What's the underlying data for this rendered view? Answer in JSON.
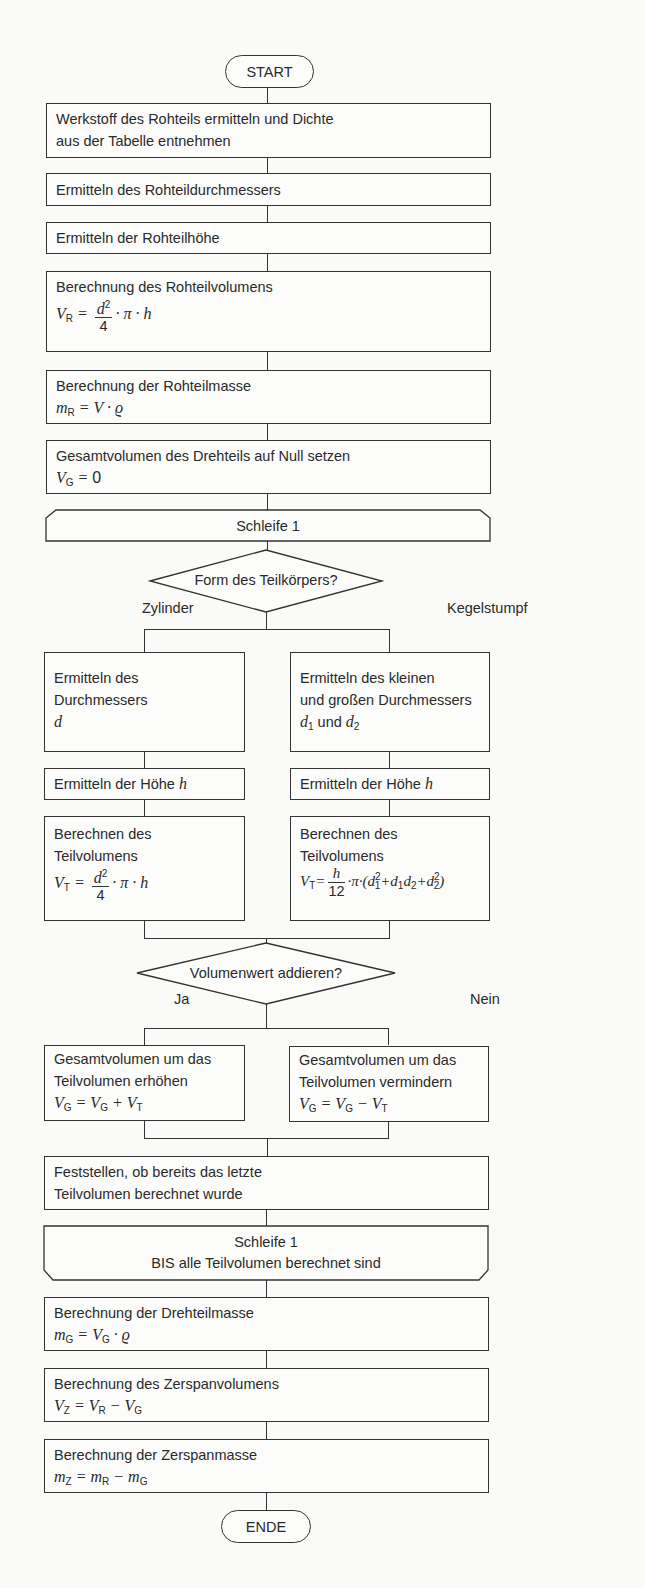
{
  "flowchart": {
    "start_label": "START",
    "end_label": "ENDE",
    "steps": [
      {
        "text_line1": "Werkstoff des Rohteils ermitteln und Dichte",
        "text_line2": "aus der Tabelle entnehmen"
      },
      {
        "text_line1": "Ermitteln des Rohteildurchmessers"
      },
      {
        "text_line1": "Ermitteln der Rohteilhöhe"
      },
      {
        "text_line1": "Berechnung des Rohteilvolumens",
        "formula": "V_R = d²/4 · π · h"
      },
      {
        "text_line1": "Berechnung der Rohteilmasse",
        "formula": "m_R = V · ϱ"
      },
      {
        "text_line1": "Gesamtvolumen des Drehteils auf Null setzen",
        "formula": "V_G = 0"
      }
    ],
    "loop_start": {
      "label": "Schleife 1"
    },
    "decision1": {
      "question": "Form des Teilkörpers?",
      "branch_left": "Zylinder",
      "branch_right": "Kegelstumpf",
      "left_steps": [
        {
          "text_line1": "Ermitteln des",
          "text_line2": "Durchmessers",
          "var": "d"
        },
        {
          "text_line1": "Ermitteln der Höhe",
          "var": "h"
        },
        {
          "text_line1": "Berechnen des",
          "text_line2": "Teilvolumens",
          "formula": "V_T = d²/4 · π · h"
        }
      ],
      "right_steps": [
        {
          "text_line1": "Ermitteln des kleinen",
          "text_line2": "und großen Durchmessers",
          "text_line3": "d₁ und d₂",
          "und": "und"
        },
        {
          "text_line1": "Ermitteln der Höhe",
          "var": "h"
        },
        {
          "text_line1": "Berechnen des",
          "text_line2": "Teilvolumens",
          "formula": "V_T = h/12 · π · (d₁² + d₁ d₂ + d₂²)"
        }
      ]
    },
    "decision2": {
      "question": "Volumenwert addieren?",
      "branch_left": "Ja",
      "branch_right": "Nein",
      "left_step": {
        "text_line1": "Gesamtvolumen um das",
        "text_line2": "Teilvolumen erhöhen",
        "formula": "V_G = V_G + V_T"
      },
      "right_step": {
        "text_line1": "Gesamtvolumen um das",
        "text_line2": "Teilvolumen vermindern",
        "formula": "V_G = V_G − V_T"
      }
    },
    "check_step": {
      "text_line1": "Feststellen, ob bereits das letzte",
      "text_line2": "Teilvolumen berechnet wurde"
    },
    "loop_end": {
      "label_line1": "Schleife 1",
      "label_line2": "BIS alle Teilvolumen berechnet sind"
    },
    "final_steps": [
      {
        "text_line1": "Berechnung der Drehteilmasse",
        "formula": "m_G = V_G · ϱ"
      },
      {
        "text_line1": "Berechnung des Zerspanvolumens",
        "formula": "V_Z = V_R − V_G"
      },
      {
        "text_line1": "Berechnung der Zerspanmasse",
        "formula": "m_Z = m_R − m_G"
      }
    ],
    "symbols": {
      "pi": "π",
      "dot": "·",
      "rho": "ϱ",
      "eq": "=",
      "plus": "+",
      "minus": "−",
      "four": "4",
      "twelve": "12",
      "zero": "0"
    }
  }
}
